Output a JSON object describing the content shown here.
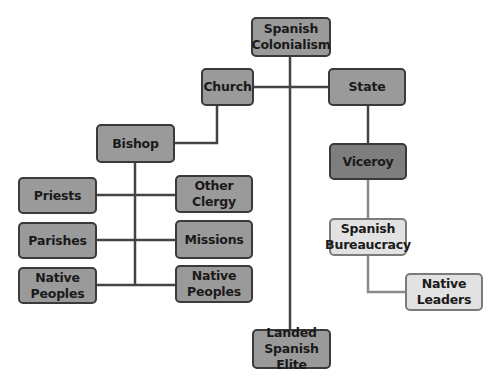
{
  "diagram": {
    "type": "hierarchy",
    "colors": {
      "node_fill": "#9a9a9a",
      "node_fill_dark": "#7e7e7e",
      "node_fill_light": "#e2e2e2",
      "border": "#3a3a3a",
      "line": "#444444",
      "line_light": "#8a8a8a"
    },
    "nodes": {
      "colonialism": "Spanish\nColonialism",
      "church": "Church",
      "state": "State",
      "bishop": "Bishop",
      "priests": "Priests",
      "other_clergy": "Other Clergy",
      "parishes": "Parishes",
      "missions": "Missions",
      "native_peoples_left": "Native\nPeoples",
      "native_peoples_right": "Native\nPeoples",
      "viceroy": "Viceroy",
      "bureaucracy": "Spanish\nBureaucracy",
      "native_leaders": "Native\nLeaders",
      "landed_elite": "Landed\nSpanish Elite"
    },
    "edges": [
      [
        "Spanish Colonialism",
        "Church"
      ],
      [
        "Spanish Colonialism",
        "State"
      ],
      [
        "Spanish Colonialism",
        "Landed Spanish Elite"
      ],
      [
        "Church",
        "Bishop"
      ],
      [
        "Bishop",
        "Priests"
      ],
      [
        "Bishop",
        "Other Clergy"
      ],
      [
        "Bishop",
        "Parishes"
      ],
      [
        "Bishop",
        "Missions"
      ],
      [
        "Bishop",
        "Native Peoples (left)"
      ],
      [
        "Bishop",
        "Native Peoples (right)"
      ],
      [
        "State",
        "Viceroy"
      ],
      [
        "Viceroy",
        "Spanish Bureaucracy"
      ],
      [
        "Spanish Bureaucracy",
        "Native Leaders"
      ]
    ]
  }
}
